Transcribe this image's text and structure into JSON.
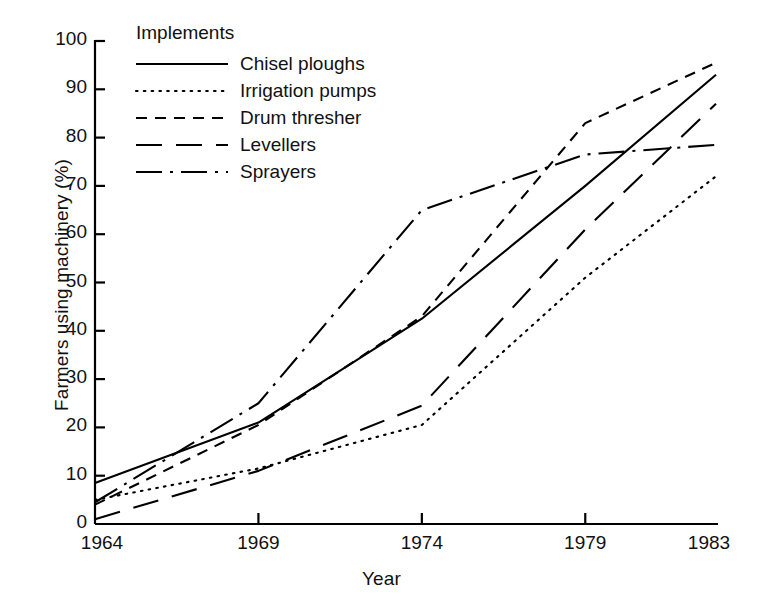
{
  "chart_data": {
    "type": "line",
    "title": "",
    "xlabel": "Year",
    "ylabel": "Farmers using machinery (%)",
    "x": [
      1964,
      1969,
      1974,
      1979,
      1983
    ],
    "xticklabels": [
      "1964",
      "1969",
      "1974",
      "1979",
      "1983"
    ],
    "yticks": [
      0,
      10,
      20,
      30,
      40,
      50,
      60,
      70,
      80,
      90,
      100
    ],
    "yticklabels": [
      "0",
      "10",
      "20",
      "30",
      "40",
      "50",
      "60",
      "70",
      "80",
      "90",
      "100"
    ],
    "xlim": [
      1964,
      1983
    ],
    "ylim": [
      0,
      100
    ],
    "grid": false,
    "legend_position": "upper-left-inside",
    "legend_title": "Implements",
    "line_color": "#000000",
    "series": [
      {
        "name": "Chisel ploughs",
        "dash": "solid",
        "values": [
          8.5,
          21,
          42.5,
          70,
          93
        ]
      },
      {
        "name": "Irrigation pumps",
        "dash": "dotted",
        "values": [
          5,
          11.5,
          20.5,
          51,
          72
        ]
      },
      {
        "name": "Drum thresher",
        "dash": "dashed",
        "values": [
          4,
          20.5,
          43,
          83,
          95.5
        ]
      },
      {
        "name": "Levellers",
        "dash": "long-dash",
        "values": [
          1,
          11,
          24.5,
          61,
          87
        ]
      },
      {
        "name": "Sprayers",
        "dash": "dash-dot",
        "values": [
          4.5,
          25,
          65,
          76.5,
          78.5
        ]
      }
    ]
  }
}
